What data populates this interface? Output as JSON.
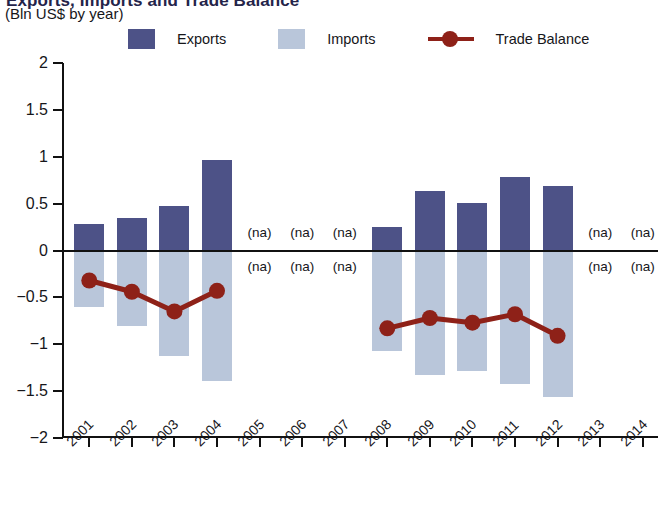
{
  "header": {
    "title_clipped": "Exports, Imports and Trade Balance",
    "subtitle": "(Bln US$ by year)"
  },
  "legend": {
    "items": [
      {
        "label": "Exports",
        "type": "swatch",
        "color": "#4d5287"
      },
      {
        "label": "Imports",
        "type": "swatch",
        "color": "#b9c6da"
      },
      {
        "label": "Trade Balance",
        "type": "line",
        "color": "#8e2118"
      }
    ]
  },
  "chart_data": {
    "type": "bar",
    "title": "Exports, Imports and Trade Balance",
    "subtitle": "(Bln US$ by year)",
    "xlabel": "",
    "ylabel": "Bln US$",
    "ylim": [
      -2,
      2
    ],
    "yticks": [
      2,
      1.5,
      1,
      0.5,
      0,
      -0.5,
      -1,
      -1.5,
      -2
    ],
    "ytick_labels": [
      "2",
      "1.5",
      "1",
      "0.5",
      "0",
      "-0.5",
      "-1",
      "-1.5",
      "-2"
    ],
    "grid": false,
    "legend_position": "top",
    "na_label": "(na)",
    "categories": [
      "2001",
      "2002",
      "2003",
      "2004",
      "2005",
      "2006",
      "2007",
      "2008",
      "2009",
      "2010",
      "2011",
      "2012",
      "2013",
      "2014"
    ],
    "series": [
      {
        "name": "Exports",
        "type": "bar",
        "color": "#4d5287",
        "values": [
          0.28,
          0.35,
          0.47,
          0.97,
          null,
          null,
          null,
          0.25,
          0.64,
          0.51,
          0.78,
          0.69,
          null,
          null
        ]
      },
      {
        "name": "Imports",
        "type": "bar",
        "color": "#b9c6da",
        "values": [
          -0.6,
          -0.8,
          -1.12,
          -1.39,
          null,
          null,
          null,
          -1.07,
          -1.33,
          -1.28,
          -1.42,
          -1.56,
          null,
          null
        ]
      },
      {
        "name": "Trade Balance",
        "type": "line",
        "color": "#8e2118",
        "values": [
          -0.32,
          -0.44,
          -0.65,
          -0.43,
          null,
          null,
          null,
          -0.83,
          -0.72,
          -0.77,
          -0.68,
          -0.91,
          null,
          null
        ]
      }
    ],
    "na_years": [
      "2005",
      "2006",
      "2007",
      "2013",
      "2014"
    ]
  }
}
